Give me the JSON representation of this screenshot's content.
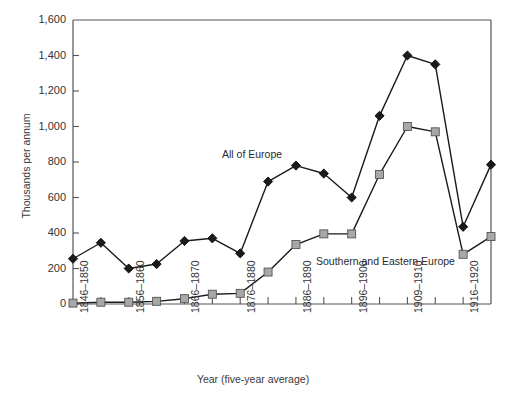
{
  "chart_data": {
    "type": "line",
    "title": "",
    "xlabel": "Year (five-year average)",
    "ylabel": "Thousands per annum",
    "categories": [
      "1846–1850",
      "1851–1855",
      "1856–1860",
      "1861–1865",
      "1866–1870",
      "1871–1875",
      "1876–1880",
      "1881–1885",
      "1886–1890",
      "1891–1895",
      "1896–1900",
      "1901–1905",
      "1909–1910",
      "1911–1915",
      "1916–1920",
      "1921–1925"
    ],
    "tick_labels": [
      "1846–1850",
      "1856–1860",
      "1866–1870",
      "1876–1880",
      "1886–1890",
      "1896–1900",
      "1909–1910",
      "1916–1920"
    ],
    "tick_label_indices": [
      0,
      2,
      4,
      6,
      8,
      10,
      12,
      14
    ],
    "series": [
      {
        "name": "All of Europe",
        "color": "#1a1a1a",
        "marker": "diamond",
        "values": [
          255,
          345,
          200,
          225,
          355,
          370,
          285,
          690,
          780,
          735,
          600,
          1060,
          1400,
          1350,
          435,
          785
        ]
      },
      {
        "name": "Southern and Eastern Europe",
        "color": "#a8a8a8",
        "marker": "square",
        "values": [
          5,
          10,
          10,
          15,
          30,
          55,
          60,
          180,
          335,
          395,
          395,
          730,
          1000,
          970,
          280,
          380
        ]
      }
    ],
    "yticks": [
      0,
      200,
      400,
      600,
      800,
      1000,
      1200,
      1400,
      1600
    ],
    "ytick_labels": [
      "0",
      "200",
      "400",
      "600",
      "800",
      "1,000",
      "1,200",
      "1,400",
      "1,600"
    ],
    "ylim": [
      0,
      1600
    ],
    "grid": false,
    "legend": "inline-annotations",
    "annotations": [
      {
        "text": "All of Europe",
        "x_index": 8,
        "y_value": 880
      },
      {
        "text": "Southern and Eastern Europe",
        "x_index": 12,
        "y_value": 330
      }
    ]
  },
  "axes": {
    "y_title": "Thousands per annum",
    "x_title": "Year (five-year average)"
  },
  "colors": {
    "series_1": "#1a1a1a",
    "series_2": "#a8a8a8",
    "axis": "#555555",
    "text": "#333333",
    "background": "#ffffff"
  }
}
